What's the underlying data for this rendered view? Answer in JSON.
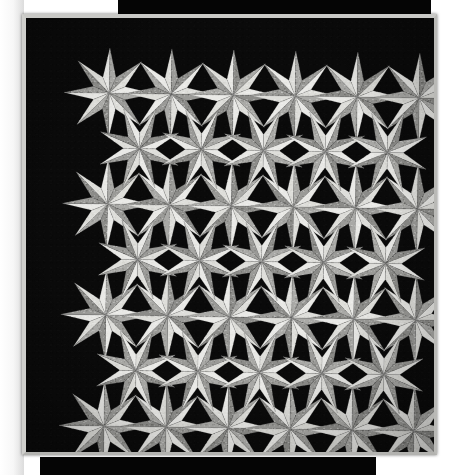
{
  "image": {
    "subject": "patchwork quilt photograph",
    "pattern_name": "eight-pointed LeMoyne star block",
    "description": "Flat-lay photograph of a monochrome patchwork quilt made of repeating eight-pointed stars in white and grey print fabrics set against solid black background squares, with a light grey binding, lying on a black surface.",
    "orientation": "slightly rotated clockwise",
    "width": 460,
    "height": 475
  },
  "palette": {
    "page_background": "#ffffff",
    "photo_backdrop": "#050505",
    "quilt_background_black": "#0a0a0a",
    "binding_light_grey": "#c9c9c6",
    "star_light": "#e9e9e6",
    "star_light_alt": "#dededa",
    "star_mid_grey": "#a9a9a6",
    "star_mid_grey_alt": "#9a9a97",
    "star_shadow_grey": "#8c8c89",
    "seam_line": "#6f6f6c"
  },
  "quilt": {
    "frame": {
      "x": 22,
      "y": 14,
      "width": 415,
      "height": 441
    },
    "binding_width_px": 4,
    "star_grid": {
      "columns": 6,
      "rows": 8,
      "spacing_x": 62.5,
      "spacing_y": 55.5
    },
    "star": {
      "points": 8,
      "point_radius": 45,
      "inner_radius": 17,
      "halves_per_point": 2,
      "half_shading": [
        "light",
        "mid-grey"
      ]
    },
    "star_centers": [
      {
        "cx": 85,
        "cy": 81
      },
      {
        "cx": 147,
        "cy": 81
      },
      {
        "cx": 209,
        "cy": 81
      },
      {
        "cx": 271,
        "cy": 81
      },
      {
        "cx": 333,
        "cy": 81
      },
      {
        "cx": 395,
        "cy": 81
      },
      {
        "cx": 85,
        "cy": 192
      },
      {
        "cx": 147,
        "cy": 192
      },
      {
        "cx": 209,
        "cy": 192
      },
      {
        "cx": 271,
        "cy": 192
      },
      {
        "cx": 333,
        "cy": 192
      },
      {
        "cx": 395,
        "cy": 192
      },
      {
        "cx": 85,
        "cy": 303
      },
      {
        "cx": 147,
        "cy": 303
      },
      {
        "cx": 209,
        "cy": 303
      },
      {
        "cx": 271,
        "cy": 303
      },
      {
        "cx": 333,
        "cy": 303
      },
      {
        "cx": 395,
        "cy": 303
      },
      {
        "cx": 85,
        "cy": 414
      },
      {
        "cx": 147,
        "cy": 414
      },
      {
        "cx": 209,
        "cy": 414
      },
      {
        "cx": 271,
        "cy": 414
      },
      {
        "cx": 333,
        "cy": 414
      },
      {
        "cx": 395,
        "cy": 414
      }
    ],
    "secondary_star_centers": [
      {
        "cx": 116,
        "cy": 136
      },
      {
        "cx": 178,
        "cy": 136
      },
      {
        "cx": 240,
        "cy": 136
      },
      {
        "cx": 302,
        "cy": 136
      },
      {
        "cx": 364,
        "cy": 136
      },
      {
        "cx": 116,
        "cy": 247
      },
      {
        "cx": 178,
        "cy": 247
      },
      {
        "cx": 240,
        "cy": 247
      },
      {
        "cx": 302,
        "cy": 247
      },
      {
        "cx": 364,
        "cy": 247
      },
      {
        "cx": 116,
        "cy": 358
      },
      {
        "cx": 178,
        "cy": 358
      },
      {
        "cx": 240,
        "cy": 358
      },
      {
        "cx": 302,
        "cy": 358
      },
      {
        "cx": 364,
        "cy": 358
      }
    ]
  },
  "backdrop": {
    "top_strip": {
      "x": 118,
      "y": 0,
      "width": 313,
      "height": 22
    },
    "bottom_strip": {
      "x": 40,
      "y": 457,
      "width": 336,
      "height": 18
    }
  }
}
